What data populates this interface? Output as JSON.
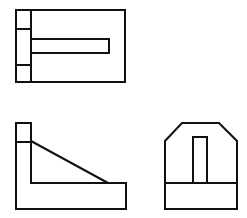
{
  "diagram": {
    "type": "orthographic-projection",
    "background": "#ffffff",
    "line_color": "#111111",
    "views": [
      {
        "name": "top-view",
        "outer": [
          [
            16,
            10
          ],
          [
            125,
            10
          ],
          [
            125,
            82
          ],
          [
            16,
            82
          ]
        ],
        "divider_x": 31,
        "left_cells_y": [
          29,
          65
        ],
        "slot": {
          "x1": 31,
          "y1": 39,
          "x2": 109,
          "y2": 53
        }
      },
      {
        "name": "front-view",
        "outline": [
          [
            16,
            123
          ],
          [
            31,
            123
          ],
          [
            31,
            183
          ],
          [
            126,
            183
          ],
          [
            126,
            209
          ],
          [
            16,
            209
          ]
        ],
        "top_cell_line_y": 142,
        "rib_diagonal": [
          [
            31,
            141
          ],
          [
            108,
            183
          ]
        ]
      },
      {
        "name": "side-view",
        "outline": [
          [
            165,
            141
          ],
          [
            182,
            123
          ],
          [
            219,
            123
          ],
          [
            237,
            141
          ],
          [
            237,
            209
          ],
          [
            165,
            209
          ]
        ],
        "base_line_y": 183,
        "slot": {
          "x1": 193,
          "y1": 137,
          "x2": 207,
          "y2": 183
        }
      }
    ]
  }
}
